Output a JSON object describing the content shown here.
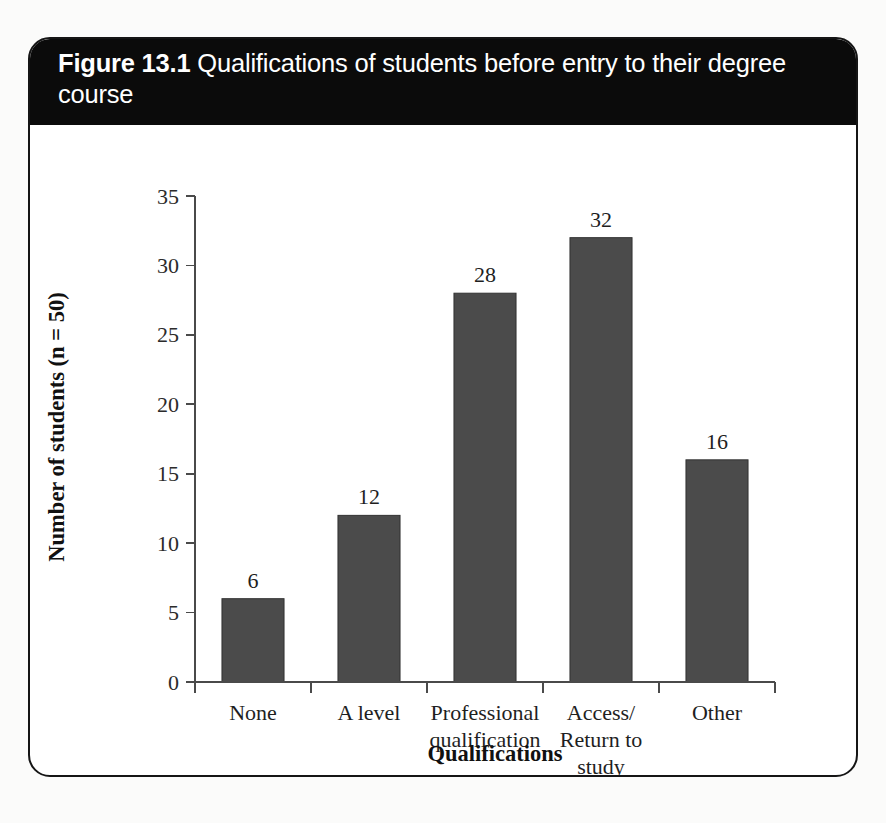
{
  "figure": {
    "number_label": "Figure 13.1",
    "caption": "Qualifications of students before entry to their degree course",
    "header_background": "#0b0b0b",
    "header_text_color": "#ffffff",
    "card_border_color": "#151515",
    "card_background": "#ffffff",
    "page_background": "#fbfbfa"
  },
  "chart_data": {
    "type": "bar",
    "title": "Qualifications of students before entry to their degree course",
    "categories": [
      "None",
      "Professional qualification",
      "A level",
      "Access/ Return to study",
      "Other"
    ],
    "category_lines": [
      [
        "None"
      ],
      [
        "A level"
      ],
      [
        "Professional",
        "qualification"
      ],
      [
        "Access/",
        "Return to",
        "study"
      ],
      [
        "Other"
      ]
    ],
    "category_labels_ordered": [
      "None",
      "A level",
      "Professional qualification",
      "Access/ Return to study",
      "Other"
    ],
    "values": [
      6,
      12,
      28,
      32,
      16
    ],
    "data_labels": [
      "6",
      "12",
      "28",
      "32",
      "16"
    ],
    "xlabel": "Qualifications",
    "ylabel": "Number of students (n = 50)",
    "ylim": [
      0,
      35
    ],
    "yticks": [
      0,
      5,
      10,
      15,
      20,
      25,
      30,
      35
    ],
    "ytick_labels": [
      "0",
      "5",
      "10",
      "15",
      "20",
      "25",
      "30",
      "35"
    ],
    "grid": false,
    "legend": null,
    "bar_color": "#4b4b4b",
    "bar_edge_color": "#323232",
    "axis_color": "#4a4a4a",
    "n": 50
  }
}
